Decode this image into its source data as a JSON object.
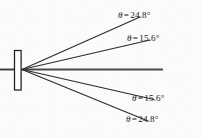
{
  "figure": {
    "type": "single-slit-diffraction-ray-diagram",
    "background_color": "#fbfbfb",
    "ink_color": "#262626",
    "width": 201,
    "height": 138
  },
  "aperture": {
    "name": "slit",
    "shape": "vertical-rectangle-outline",
    "x": 14,
    "y": 50,
    "width": 7,
    "height": 40,
    "fill": "#ffffff",
    "stroke": "#1f1f1f"
  },
  "incident_beam": {
    "label": "",
    "from_x": 0,
    "to_x": 14,
    "y": 69.5
  },
  "vertex": {
    "x": 22,
    "y": 69.5
  },
  "rays": [
    {
      "name": "ray-top-outer",
      "angle_deg": 24.8,
      "direction": "up",
      "end_x": 140,
      "end_y": 17.0
    },
    {
      "name": "ray-top-inner",
      "angle_deg": 15.6,
      "direction": "up",
      "end_x": 150,
      "end_y": 40.0
    },
    {
      "name": "ray-center",
      "angle_deg": 0.0,
      "direction": "axis",
      "end_x": 163,
      "end_y": 69.5
    },
    {
      "name": "ray-bot-inner",
      "angle_deg": 15.6,
      "direction": "down",
      "end_x": 154,
      "end_y": 99.5
    },
    {
      "name": "ray-bot-outer",
      "angle_deg": 24.8,
      "direction": "down",
      "end_x": 148,
      "end_y": 121.0
    }
  ],
  "labels": {
    "top_outer": {
      "symbol": "θ",
      "equals": "=",
      "value": "24.8°",
      "full": "θ = 24.8°"
    },
    "top_inner": {
      "symbol": "θ",
      "equals": "=",
      "value": "15.6°",
      "full": "θ = 15.6°"
    },
    "bot_inner": {
      "symbol": "θ",
      "equals": "=",
      "value": "15.6°",
      "full": "θ = 15.6°"
    },
    "bot_outer": {
      "symbol": "θ",
      "equals": "=",
      "value": "24.8°",
      "full": "θ = 24.8°"
    }
  }
}
